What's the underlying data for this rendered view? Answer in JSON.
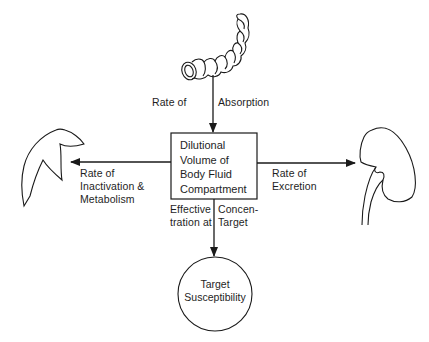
{
  "diagram": {
    "absorption_label": "Rate of  Absorption",
    "absorption_label_left": "Rate of",
    "absorption_label_right": "Absorption",
    "central_box": {
      "lines": [
        "Dilutional",
        "Volume of",
        "Body Fluid",
        "Compartment"
      ]
    },
    "inactivation_label": {
      "lines": [
        "Rate of",
        "Inactivation &",
        "Metabolism"
      ]
    },
    "excretion_label": {
      "lines": [
        "Rate of",
        "Excretion"
      ]
    },
    "effective_concentration_label": {
      "left_lines": [
        "Effective",
        "tration at"
      ],
      "right_lines": [
        "Concen-",
        "Target"
      ]
    },
    "target_circle": {
      "lines": [
        "Target",
        "Susceptibility"
      ]
    },
    "icons": {
      "top": "intestine-icon",
      "left": "liver-icon",
      "right": "kidney-icon"
    },
    "colors": {
      "stroke": "#1a1a1a",
      "background": "#ffffff"
    }
  }
}
